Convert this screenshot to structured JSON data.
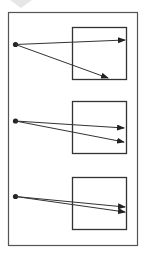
{
  "diagram": {
    "colors": {
      "stroke": "#333333",
      "frame": "#555555",
      "background": "#ffffff"
    },
    "panels": [
      {
        "id": "panel-1",
        "arrows": 2,
        "divergence": "wide"
      },
      {
        "id": "panel-2",
        "arrows": 2,
        "divergence": "medium"
      },
      {
        "id": "panel-3",
        "arrows": 2,
        "divergence": "narrow"
      }
    ]
  }
}
